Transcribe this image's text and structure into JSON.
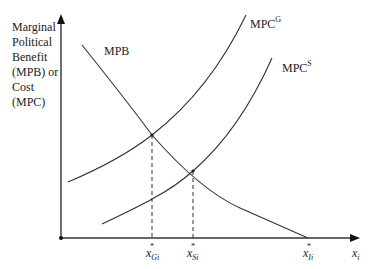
{
  "diagram": {
    "y_axis_label_lines": [
      "Marginal",
      "Political",
      "Benefit",
      "(MPB) or",
      "Cost",
      "(MPC)"
    ],
    "x_axis_label": {
      "base": "x",
      "sub": "i"
    },
    "curves": {
      "mpb": {
        "label": "MPB"
      },
      "mpc_g": {
        "label": "MPC",
        "sup": "G"
      },
      "mpc_s": {
        "label": "MPC",
        "sup": "S"
      }
    },
    "x_markers": [
      {
        "base": "x",
        "star": "*",
        "sub": "Gi"
      },
      {
        "base": "x",
        "star": "*",
        "sub": "Si"
      },
      {
        "base": "x",
        "star": "*",
        "sub": "Ii"
      }
    ],
    "colors": {
      "line": "#333333",
      "background": "#ffffff"
    }
  }
}
